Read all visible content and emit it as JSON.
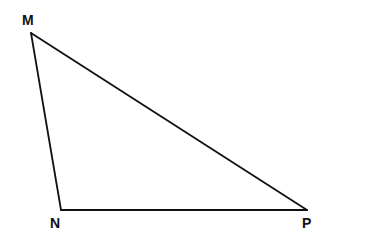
{
  "diagram": {
    "type": "triangle",
    "vertices": [
      {
        "id": "M",
        "label": "M"
      },
      {
        "id": "N",
        "label": "N"
      },
      {
        "id": "P",
        "label": "P"
      }
    ],
    "edges": [
      {
        "from": "M",
        "to": "N",
        "name": "MN"
      },
      {
        "from": "N",
        "to": "P",
        "name": "NP"
      },
      {
        "from": "P",
        "to": "M",
        "name": "PM"
      }
    ],
    "colors": {
      "stroke": "#111111",
      "background": "#ffffff"
    }
  }
}
